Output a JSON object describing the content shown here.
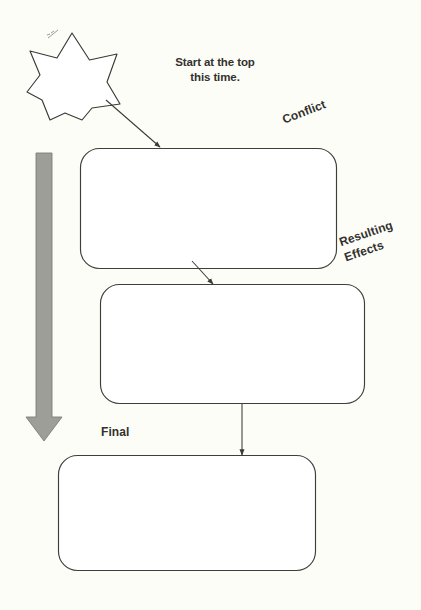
{
  "page": {
    "background_color": "#fdfdf8",
    "width": 421,
    "height": 610
  },
  "annotations": {
    "instruction": "Start at the top\nthis time.",
    "star_note": "pencil-scribble-mark"
  },
  "labels": {
    "conflict": "Conflict",
    "resulting_effects": "Resulting\nEffects",
    "final": "Final"
  },
  "shapes": {
    "star": {
      "name": "seven-pointed-star",
      "points": 7,
      "stroke": "#3a3a36",
      "fill": "#ffffff"
    },
    "direction_arrow": {
      "name": "downward-flow-arrow",
      "color": "#9e9e99",
      "direction": "down"
    },
    "boxes": [
      {
        "id": "conflict-box",
        "label_ref": "conflict",
        "value": "",
        "stroke": "#3f3f3a",
        "fill": "#ffffff"
      },
      {
        "id": "resulting-effects-box",
        "label_ref": "resulting_effects",
        "value": "",
        "stroke": "#3f3f3a",
        "fill": "#ffffff"
      },
      {
        "id": "final-box",
        "label_ref": "final",
        "value": "",
        "stroke": "#3f3f3a",
        "fill": "#ffffff"
      }
    ],
    "connectors": [
      {
        "id": "star-to-conflict",
        "from": "star",
        "to": "conflict-box",
        "style": "diagonal-arrow"
      },
      {
        "id": "conflict-to-effects",
        "from": "conflict-box",
        "to": "resulting-effects-box",
        "style": "short-diagonal-arrow"
      },
      {
        "id": "effects-to-final",
        "from": "resulting-effects-box",
        "to": "final-box",
        "style": "vertical-arrow"
      }
    ]
  }
}
